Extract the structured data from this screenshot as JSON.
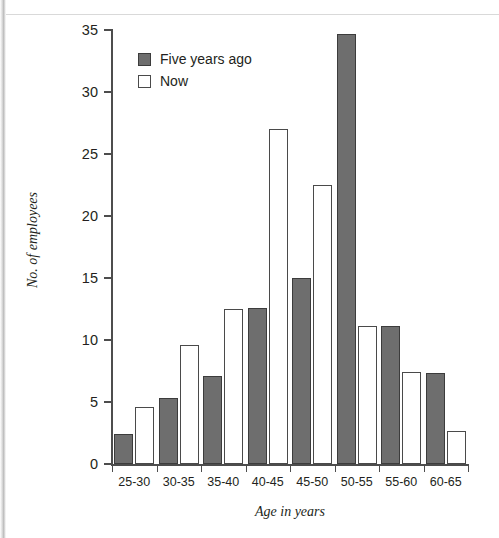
{
  "chart_data": {
    "type": "bar",
    "title": "",
    "xlabel": "Age in years",
    "ylabel": "No. of employees",
    "categories": [
      "25-30",
      "30-35",
      "35-40",
      "40-45",
      "45-50",
      "50-55",
      "55-60",
      "60-65"
    ],
    "series": [
      {
        "name": "Five years ago",
        "color": "#6e6e6e",
        "values": [
          2.4,
          5.3,
          7.1,
          12.6,
          15.0,
          34.7,
          11.1,
          7.3
        ]
      },
      {
        "name": "Now",
        "color": "#ffffff",
        "values": [
          4.6,
          9.6,
          12.5,
          27.0,
          22.5,
          11.1,
          7.4,
          2.7
        ]
      }
    ],
    "ylim": [
      0,
      35
    ],
    "yticks": [
      0,
      5,
      10,
      15,
      20,
      25,
      30,
      35
    ],
    "ytick_labels": [
      "0",
      "5",
      "10",
      "15",
      "20",
      "25",
      "30",
      "35"
    ],
    "grid": false,
    "legend_position": "top-left-inside"
  },
  "legend": {
    "items": [
      {
        "label": "Five years ago",
        "swatch": "filled-gray-swatch"
      },
      {
        "label": "Now",
        "swatch": "empty-white-swatch"
      }
    ]
  },
  "axes": {
    "x_title": "Age in years",
    "y_title": "No. of employees"
  }
}
